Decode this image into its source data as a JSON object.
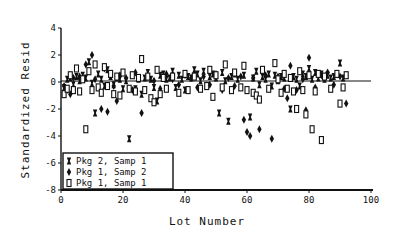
{
  "chart_data": {
    "type": "scatter",
    "title": "",
    "xlabel": "Lot Number",
    "ylabel": "Standardized Resid",
    "xlim": [
      0,
      100
    ],
    "ylim": [
      -8,
      4
    ],
    "xticks": [
      "0",
      "20",
      "40",
      "60",
      "80",
      "100"
    ],
    "xtick_values": [
      0,
      20,
      40,
      60,
      80,
      100
    ],
    "yticks": [
      "4",
      "2",
      "0",
      "-2",
      "-4",
      "-6",
      "-8"
    ],
    "ytick_values": [
      4,
      2,
      0,
      -2,
      -4,
      -6,
      -8
    ],
    "reference_line": 0,
    "grid": false,
    "legend_position": "bottom-left",
    "series": [
      {
        "name": "Pkg 2, Samp 1",
        "marker": "bowtie",
        "points": [
          [
            1,
            -0.4
          ],
          [
            2,
            0.2
          ],
          [
            3,
            0.3
          ],
          [
            4,
            -0.2
          ],
          [
            5,
            0.4
          ],
          [
            6,
            0.1
          ],
          [
            7,
            0.5
          ],
          [
            8,
            0.3
          ],
          [
            9,
            1.5
          ],
          [
            10,
            -0.1
          ],
          [
            11,
            -2.3
          ],
          [
            12,
            0.6
          ],
          [
            13,
            0.2
          ],
          [
            14,
            -0.3
          ],
          [
            15,
            0.9
          ],
          [
            16,
            0.4
          ],
          [
            17,
            -0.2
          ],
          [
            18,
            0.3
          ],
          [
            19,
            0.2
          ],
          [
            20,
            -0.5
          ],
          [
            21,
            0.1
          ],
          [
            22,
            -4.2
          ],
          [
            23,
            0.5
          ],
          [
            24,
            -0.5
          ],
          [
            25,
            0.2
          ],
          [
            26,
            -0.9
          ],
          [
            27,
            0.3
          ],
          [
            28,
            0.7
          ],
          [
            29,
            0.2
          ],
          [
            30,
            -0.4
          ],
          [
            31,
            -1.4
          ],
          [
            32,
            0.5
          ],
          [
            33,
            0.6
          ],
          [
            34,
            0.2
          ],
          [
            35,
            0.3
          ],
          [
            36,
            0.8
          ],
          [
            37,
            -0.4
          ],
          [
            38,
            0.5
          ],
          [
            39,
            0.2
          ],
          [
            40,
            -0.6
          ],
          [
            41,
            0.4
          ],
          [
            42,
            0.3
          ],
          [
            43,
            0.9
          ],
          [
            44,
            0.6
          ],
          [
            45,
            0.1
          ],
          [
            46,
            0.8
          ],
          [
            47,
            -0.3
          ],
          [
            48,
            0.4
          ],
          [
            49,
            0.6
          ],
          [
            50,
            0.3
          ],
          [
            51,
            -2.3
          ],
          [
            52,
            0.7
          ],
          [
            53,
            0.1
          ],
          [
            54,
            -2.9
          ],
          [
            55,
            0.4
          ],
          [
            56,
            0.6
          ],
          [
            57,
            0.2
          ],
          [
            58,
            -0.4
          ],
          [
            59,
            0.5
          ],
          [
            61,
            -2.6
          ],
          [
            62,
            0.3
          ],
          [
            63,
            0.8
          ],
          [
            64,
            -0.2
          ],
          [
            65,
            0.4
          ],
          [
            66,
            0.2
          ],
          [
            67,
            0.6
          ],
          [
            68,
            -0.3
          ],
          [
            69,
            0.5
          ],
          [
            70,
            0.1
          ],
          [
            71,
            0.4
          ],
          [
            72,
            0.3
          ],
          [
            74,
            -2.0
          ],
          [
            75,
            0.4
          ],
          [
            76,
            0.2
          ],
          [
            77,
            -0.3
          ],
          [
            78,
            0.6
          ],
          [
            79,
            0.4
          ],
          [
            80,
            1.0
          ],
          [
            81,
            0.2
          ],
          [
            82,
            0.7
          ],
          [
            83,
            0.3
          ],
          [
            84,
            0.6
          ],
          [
            85,
            0.2
          ],
          [
            86,
            0.5
          ],
          [
            87,
            0.3
          ],
          [
            88,
            0.4
          ],
          [
            89,
            0.6
          ],
          [
            90,
            1.4
          ],
          [
            91,
            0.3
          ],
          [
            92,
            0.5
          ]
        ]
      },
      {
        "name": "Pkg 1, Samp 2",
        "marker": "diamond",
        "points": [
          [
            1,
            -0.3
          ],
          [
            2,
            -0.6
          ],
          [
            3,
            -0.9
          ],
          [
            4,
            0.3
          ],
          [
            6,
            0.4
          ],
          [
            8,
            1.3
          ],
          [
            10,
            2.0
          ],
          [
            11,
            0.2
          ],
          [
            12,
            -0.4
          ],
          [
            13,
            -2.0
          ],
          [
            14,
            1.0
          ],
          [
            15,
            -2.2
          ],
          [
            16,
            0.6
          ],
          [
            17,
            -0.3
          ],
          [
            18,
            -1.4
          ],
          [
            19,
            0.5
          ],
          [
            21,
            0.3
          ],
          [
            23,
            -0.6
          ],
          [
            24,
            0.7
          ],
          [
            26,
            -2.3
          ],
          [
            28,
            0.4
          ],
          [
            30,
            0.1
          ],
          [
            32,
            -0.5
          ],
          [
            34,
            0.6
          ],
          [
            36,
            0.2
          ],
          [
            38,
            -0.2
          ],
          [
            40,
            0.5
          ],
          [
            42,
            0.3
          ],
          [
            44,
            -0.4
          ],
          [
            46,
            0.4
          ],
          [
            48,
            -0.2
          ],
          [
            50,
            0.6
          ],
          [
            52,
            -0.6
          ],
          [
            54,
            0.3
          ],
          [
            56,
            -0.3
          ],
          [
            58,
            0.4
          ],
          [
            59,
            -2.8
          ],
          [
            60,
            -3.7
          ],
          [
            61,
            -4.0
          ],
          [
            62,
            0.3
          ],
          [
            64,
            -3.5
          ],
          [
            66,
            0.5
          ],
          [
            68,
            -4.2
          ],
          [
            70,
            0.4
          ],
          [
            72,
            -0.5
          ],
          [
            73,
            -1.2
          ],
          [
            74,
            1.2
          ],
          [
            76,
            -0.6
          ],
          [
            78,
            0.2
          ],
          [
            79,
            -2.1
          ],
          [
            80,
            1.8
          ],
          [
            82,
            -0.4
          ],
          [
            84,
            0.5
          ],
          [
            86,
            0.7
          ],
          [
            88,
            -0.2
          ],
          [
            90,
            0.4
          ],
          [
            92,
            -1.6
          ]
        ]
      },
      {
        "name": "Pkg 1, Samp 1",
        "marker": "square",
        "points": [
          [
            1,
            -0.9
          ],
          [
            2,
            -0.5
          ],
          [
            3,
            0.5
          ],
          [
            4,
            -0.6
          ],
          [
            5,
            1.0
          ],
          [
            6,
            -0.7
          ],
          [
            7,
            0.2
          ],
          [
            8,
            -3.5
          ],
          [
            9,
            0.8
          ],
          [
            10,
            -0.6
          ],
          [
            11,
            1.3
          ],
          [
            12,
            -0.4
          ],
          [
            13,
            -0.8
          ],
          [
            14,
            1.1
          ],
          [
            15,
            -0.3
          ],
          [
            16,
            0.6
          ],
          [
            17,
            -0.9
          ],
          [
            18,
            0.4
          ],
          [
            19,
            -1.0
          ],
          [
            20,
            0.7
          ],
          [
            22,
            -0.5
          ],
          [
            23,
            0.5
          ],
          [
            24,
            -0.7
          ],
          [
            25,
            0.3
          ],
          [
            26,
            1.7
          ],
          [
            27,
            -0.6
          ],
          [
            28,
            0.4
          ],
          [
            29,
            -1.2
          ],
          [
            30,
            -1.5
          ],
          [
            31,
            0.9
          ],
          [
            32,
            -0.9
          ],
          [
            33,
            0.3
          ],
          [
            34,
            -0.5
          ],
          [
            36,
            0.4
          ],
          [
            38,
            -0.8
          ],
          [
            40,
            0.6
          ],
          [
            41,
            -0.6
          ],
          [
            43,
            0.4
          ],
          [
            45,
            -0.5
          ],
          [
            47,
            -0.3
          ],
          [
            48,
            0.9
          ],
          [
            49,
            -1.1
          ],
          [
            50,
            0.5
          ],
          [
            52,
            -0.4
          ],
          [
            53,
            1.3
          ],
          [
            55,
            -0.6
          ],
          [
            56,
            0.7
          ],
          [
            58,
            -0.4
          ],
          [
            59,
            1.2
          ],
          [
            60,
            -0.6
          ],
          [
            62,
            -0.8
          ],
          [
            63,
            -1.0
          ],
          [
            64,
            -1.3
          ],
          [
            65,
            0.9
          ],
          [
            67,
            -0.5
          ],
          [
            69,
            1.4
          ],
          [
            70,
            0.2
          ],
          [
            71,
            -0.8
          ],
          [
            72,
            0.6
          ],
          [
            73,
            -0.5
          ],
          [
            74,
            0.3
          ],
          [
            75,
            -0.7
          ],
          [
            76,
            -2.0
          ],
          [
            77,
            0.8
          ],
          [
            78,
            -0.6
          ],
          [
            79,
            -2.4
          ],
          [
            80,
            0.5
          ],
          [
            81,
            -3.5
          ],
          [
            82,
            -0.7
          ],
          [
            83,
            0.6
          ],
          [
            84,
            -4.3
          ],
          [
            85,
            0.4
          ],
          [
            87,
            -0.5
          ],
          [
            89,
            0.6
          ],
          [
            90,
            -1.6
          ],
          [
            91,
            -0.4
          ],
          [
            92,
            0.5
          ]
        ]
      }
    ]
  }
}
